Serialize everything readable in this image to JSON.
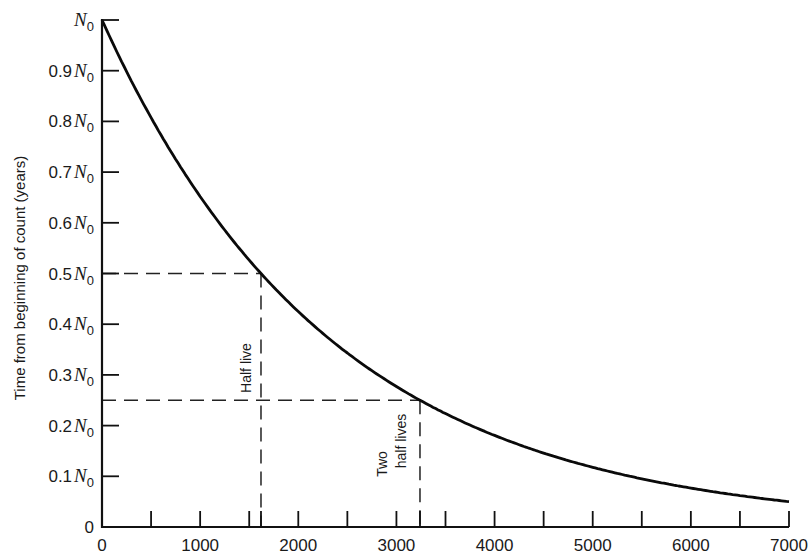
{
  "chart_data": {
    "type": "line",
    "title": "",
    "xlabel": "",
    "ylabel": "Time from beginning of count (years)",
    "xlim": [
      0,
      7000
    ],
    "ylim": [
      0,
      1
    ],
    "grid": false,
    "legend": null,
    "x_ticks": [
      0,
      500,
      1000,
      1500,
      2000,
      2500,
      3000,
      3500,
      4000,
      4500,
      5000,
      5500,
      6000,
      6500,
      7000
    ],
    "x_tick_labels": [
      "0",
      "1000",
      "2000",
      "3000",
      "4000",
      "5000",
      "6000",
      "7000"
    ],
    "x_tick_label_values": [
      0,
      1000,
      2000,
      3000,
      4000,
      5000,
      6000,
      7000
    ],
    "y_ticks": [
      {
        "value": 1.0,
        "prefix": "",
        "symbol": "N",
        "sub": "0"
      },
      {
        "value": 0.9,
        "prefix": "0.9",
        "symbol": "N",
        "sub": "0"
      },
      {
        "value": 0.8,
        "prefix": "0.8",
        "symbol": "N",
        "sub": "0"
      },
      {
        "value": 0.7,
        "prefix": "0.7",
        "symbol": "N",
        "sub": "0"
      },
      {
        "value": 0.6,
        "prefix": "0.6",
        "symbol": "N",
        "sub": "0"
      },
      {
        "value": 0.5,
        "prefix": "0.5",
        "symbol": "N",
        "sub": "0"
      },
      {
        "value": 0.4,
        "prefix": "0.4",
        "symbol": "N",
        "sub": "0"
      },
      {
        "value": 0.3,
        "prefix": "0.3",
        "symbol": "N",
        "sub": "0"
      },
      {
        "value": 0.2,
        "prefix": "0.2",
        "symbol": "N",
        "sub": "0"
      },
      {
        "value": 0.1,
        "prefix": "0.1",
        "symbol": "N",
        "sub": "0"
      },
      {
        "value": 0.0,
        "prefix": "0",
        "symbol": "",
        "sub": ""
      }
    ],
    "series": [
      {
        "name": "Exponential decay N/N0",
        "half_life": 1620,
        "x": [
          0,
          500,
          1000,
          1500,
          1620,
          2000,
          2500,
          3000,
          3240,
          3500,
          4000,
          4500,
          5000,
          5500,
          6000,
          6500,
          7000
        ],
        "values": [
          1.0,
          0.807,
          0.652,
          0.526,
          0.5,
          0.425,
          0.343,
          0.277,
          0.25,
          0.224,
          0.181,
          0.146,
          0.118,
          0.095,
          0.077,
          0.062,
          0.05
        ]
      }
    ],
    "annotations": [
      {
        "label": "Half live",
        "x": 1620,
        "y": 0.5,
        "style": "dashed"
      },
      {
        "label_line1": "Two",
        "label_line2": "half lives",
        "x": 3240,
        "y": 0.25,
        "style": "dashed"
      }
    ]
  }
}
